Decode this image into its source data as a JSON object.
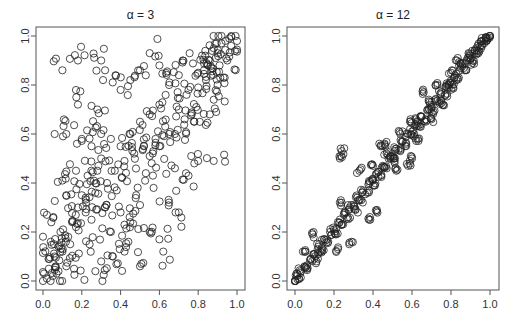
{
  "chart_data": [
    {
      "type": "scatter",
      "title": "α = 3",
      "xlabel": "",
      "ylabel": "",
      "xlim": [
        0,
        1
      ],
      "ylim": [
        0,
        1
      ],
      "xticks": [
        "0.0",
        "0.2",
        "0.4",
        "0.6",
        "0.8",
        "1.0"
      ],
      "yticks": [
        "0.0",
        "0.2",
        "0.4",
        "0.6",
        "0.8",
        "1.0"
      ],
      "marker": "open-circle",
      "grid": false,
      "description": "About 500 points; moderate positive dependence, wide spread, tighter near (1,1)",
      "points": [
        [
          0.02,
          0.01
        ],
        [
          0.03,
          0.05
        ],
        [
          0.05,
          0.02
        ],
        [
          0.06,
          0.1
        ],
        [
          0.08,
          0.04
        ],
        [
          0.1,
          0.12
        ],
        [
          0.12,
          0.06
        ],
        [
          0.14,
          0.15
        ],
        [
          0.04,
          0.16
        ],
        [
          0.09,
          0.2
        ],
        [
          0.02,
          0.27
        ],
        [
          0.15,
          0.24
        ],
        [
          0.18,
          0.3
        ],
        [
          0.2,
          0.35
        ],
        [
          0.22,
          0.34
        ],
        [
          0.25,
          0.25
        ],
        [
          0.12,
          0.35
        ],
        [
          0.1,
          0.41
        ],
        [
          0.17,
          0.45
        ],
        [
          0.23,
          0.43
        ],
        [
          0.28,
          0.45
        ],
        [
          0.3,
          0.5
        ],
        [
          0.32,
          0.3
        ],
        [
          0.35,
          0.2
        ],
        [
          0.38,
          0.37
        ],
        [
          0.4,
          0.28
        ],
        [
          0.42,
          0.12
        ],
        [
          0.45,
          0.24
        ],
        [
          0.48,
          0.35
        ],
        [
          0.5,
          0.31
        ],
        [
          0.53,
          0.44
        ],
        [
          0.55,
          0.2
        ],
        [
          0.6,
          0.17
        ],
        [
          0.62,
          0.12
        ],
        [
          0.57,
          0.38
        ],
        [
          0.65,
          0.32
        ],
        [
          0.7,
          0.28
        ],
        [
          0.68,
          0.46
        ],
        [
          0.75,
          0.43
        ],
        [
          0.78,
          0.48
        ],
        [
          0.88,
          0.49
        ],
        [
          0.4,
          0.55
        ],
        [
          0.45,
          0.6
        ],
        [
          0.5,
          0.65
        ],
        [
          0.55,
          0.68
        ],
        [
          0.6,
          0.72
        ],
        [
          0.35,
          0.58
        ],
        [
          0.3,
          0.6
        ],
        [
          0.25,
          0.55
        ],
        [
          0.2,
          0.58
        ],
        [
          0.12,
          0.6
        ],
        [
          0.06,
          0.6
        ],
        [
          0.18,
          0.72
        ],
        [
          0.28,
          0.7
        ],
        [
          0.4,
          0.78
        ],
        [
          0.45,
          0.82
        ],
        [
          0.5,
          0.86
        ],
        [
          0.55,
          0.93
        ],
        [
          0.6,
          0.88
        ],
        [
          0.65,
          0.8
        ],
        [
          0.7,
          0.84
        ],
        [
          0.72,
          0.9
        ],
        [
          0.75,
          0.78
        ],
        [
          0.8,
          0.85
        ],
        [
          0.82,
          0.92
        ],
        [
          0.85,
          0.88
        ],
        [
          0.88,
          0.95
        ],
        [
          0.9,
          0.93
        ],
        [
          0.92,
          0.97
        ],
        [
          0.94,
          0.98
        ],
        [
          0.96,
          0.99
        ],
        [
          0.95,
          0.9
        ],
        [
          0.93,
          0.83
        ],
        [
          0.9,
          0.8
        ],
        [
          0.88,
          0.74
        ],
        [
          0.86,
          0.68
        ],
        [
          0.79,
          0.71
        ],
        [
          0.73,
          0.66
        ],
        [
          0.68,
          0.6
        ],
        [
          0.63,
          0.63
        ],
        [
          0.58,
          0.58
        ],
        [
          0.52,
          0.55
        ],
        [
          0.47,
          0.52
        ],
        [
          0.42,
          0.49
        ],
        [
          0.37,
          0.45
        ],
        [
          0.33,
          0.4
        ],
        [
          0.27,
          0.36
        ],
        [
          0.22,
          0.28
        ],
        [
          0.17,
          0.22
        ],
        [
          0.13,
          0.18
        ],
        [
          0.08,
          0.14
        ],
        [
          0.1,
          0.86
        ],
        [
          0.3,
          0.9
        ],
        [
          0.32,
          0.86
        ],
        [
          0.18,
          0.9
        ],
        [
          0.78,
          0.65
        ],
        [
          0.84,
          0.82
        ],
        [
          0.91,
          0.88
        ],
        [
          0.97,
          0.96
        ],
        [
          0.24,
          0.15
        ],
        [
          0.3,
          0.08
        ],
        [
          0.36,
          0.1
        ],
        [
          0.44,
          0.16
        ],
        [
          0.5,
          0.06
        ],
        [
          0.27,
          0.04
        ],
        [
          0.16,
          0.05
        ],
        [
          0.07,
          0.03
        ],
        [
          0.55,
          0.51
        ],
        [
          0.6,
          0.55
        ],
        [
          0.65,
          0.6
        ],
        [
          0.7,
          0.7
        ],
        [
          0.74,
          0.76
        ],
        [
          0.8,
          0.79
        ],
        [
          0.83,
          0.86
        ],
        [
          0.86,
          0.9
        ],
        [
          0.89,
          0.91
        ]
      ]
    },
    {
      "type": "scatter",
      "title": "α = 12",
      "xlabel": "",
      "ylabel": "",
      "xlim": [
        0,
        1
      ],
      "ylim": [
        0,
        1
      ],
      "xticks": [
        "0.0",
        "0.2",
        "0.4",
        "0.6",
        "0.8",
        "1.0"
      ],
      "yticks": [
        "0.0",
        "0.2",
        "0.4",
        "0.6",
        "0.8",
        "1.0"
      ],
      "marker": "open-circle",
      "grid": false,
      "description": "About 500 points; strong positive dependence, points concentrated tightly along diagonal y=x",
      "points": [
        [
          0.0,
          0.0
        ],
        [
          0.01,
          0.02
        ],
        [
          0.02,
          0.01
        ],
        [
          0.03,
          0.04
        ],
        [
          0.05,
          0.06
        ],
        [
          0.06,
          0.05
        ],
        [
          0.08,
          0.09
        ],
        [
          0.1,
          0.11
        ],
        [
          0.11,
          0.08
        ],
        [
          0.12,
          0.14
        ],
        [
          0.14,
          0.13
        ],
        [
          0.15,
          0.17
        ],
        [
          0.17,
          0.16
        ],
        [
          0.18,
          0.2
        ],
        [
          0.2,
          0.21
        ],
        [
          0.21,
          0.19
        ],
        [
          0.22,
          0.24
        ],
        [
          0.24,
          0.23
        ],
        [
          0.25,
          0.27
        ],
        [
          0.27,
          0.26
        ],
        [
          0.28,
          0.3
        ],
        [
          0.3,
          0.31
        ],
        [
          0.31,
          0.29
        ],
        [
          0.32,
          0.34
        ],
        [
          0.34,
          0.33
        ],
        [
          0.35,
          0.37
        ],
        [
          0.37,
          0.36
        ],
        [
          0.38,
          0.4
        ],
        [
          0.4,
          0.41
        ],
        [
          0.41,
          0.39
        ],
        [
          0.42,
          0.44
        ],
        [
          0.44,
          0.43
        ],
        [
          0.45,
          0.47
        ],
        [
          0.47,
          0.46
        ],
        [
          0.48,
          0.5
        ],
        [
          0.5,
          0.51
        ],
        [
          0.51,
          0.49
        ],
        [
          0.52,
          0.54
        ],
        [
          0.54,
          0.53
        ],
        [
          0.55,
          0.57
        ],
        [
          0.57,
          0.56
        ],
        [
          0.58,
          0.6
        ],
        [
          0.6,
          0.61
        ],
        [
          0.61,
          0.59
        ],
        [
          0.62,
          0.64
        ],
        [
          0.64,
          0.63
        ],
        [
          0.65,
          0.67
        ],
        [
          0.67,
          0.66
        ],
        [
          0.68,
          0.7
        ],
        [
          0.7,
          0.71
        ],
        [
          0.71,
          0.69
        ],
        [
          0.72,
          0.74
        ],
        [
          0.74,
          0.73
        ],
        [
          0.75,
          0.77
        ],
        [
          0.77,
          0.76
        ],
        [
          0.78,
          0.8
        ],
        [
          0.8,
          0.81
        ],
        [
          0.81,
          0.79
        ],
        [
          0.82,
          0.84
        ],
        [
          0.84,
          0.83
        ],
        [
          0.85,
          0.87
        ],
        [
          0.87,
          0.86
        ],
        [
          0.88,
          0.9
        ],
        [
          0.9,
          0.91
        ],
        [
          0.91,
          0.89
        ],
        [
          0.92,
          0.93
        ],
        [
          0.94,
          0.94
        ],
        [
          0.95,
          0.96
        ],
        [
          0.97,
          0.97
        ],
        [
          0.98,
          0.99
        ],
        [
          1.0,
          1.0
        ],
        [
          0.09,
          0.19
        ],
        [
          0.13,
          0.12
        ],
        [
          0.05,
          0.12
        ],
        [
          0.23,
          0.32
        ],
        [
          0.22,
          0.13
        ],
        [
          0.29,
          0.16
        ],
        [
          0.38,
          0.25
        ],
        [
          0.42,
          0.29
        ],
        [
          0.33,
          0.45
        ],
        [
          0.23,
          0.5
        ],
        [
          0.24,
          0.53
        ],
        [
          0.4,
          0.47
        ],
        [
          0.47,
          0.52
        ],
        [
          0.52,
          0.45
        ],
        [
          0.58,
          0.47
        ],
        [
          0.44,
          0.55
        ],
        [
          0.6,
          0.5
        ],
        [
          0.62,
          0.66
        ],
        [
          0.66,
          0.77
        ],
        [
          0.7,
          0.66
        ],
        [
          0.78,
          0.79
        ],
        [
          0.8,
          0.85
        ],
        [
          0.83,
          0.9
        ],
        [
          0.86,
          0.89
        ],
        [
          0.89,
          0.93
        ],
        [
          0.93,
          0.95
        ],
        [
          0.96,
          0.98
        ],
        [
          0.99,
          0.99
        ],
        [
          0.46,
          0.56
        ],
        [
          0.54,
          0.6
        ],
        [
          0.59,
          0.65
        ],
        [
          0.63,
          0.58
        ],
        [
          0.69,
          0.73
        ],
        [
          0.73,
          0.8
        ],
        [
          0.76,
          0.72
        ]
      ]
    }
  ]
}
